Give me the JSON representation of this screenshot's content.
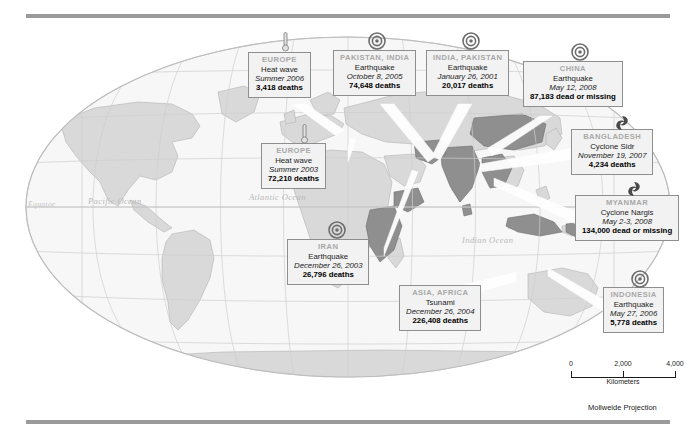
{
  "figure": {
    "projection_note": "Mollweide Projection"
  },
  "geo_labels": [
    {
      "name": "equator",
      "text": "Equator",
      "x": 28,
      "y": 228,
      "size": 7.5
    },
    {
      "name": "pacific-ocean",
      "text": "Pacific Ocean",
      "x": 88,
      "y": 198,
      "size": 8.5
    },
    {
      "name": "atlantic-ocean",
      "text": "Atlantic Ocean",
      "x": 249,
      "y": 194,
      "size": 8.5
    },
    {
      "name": "indian-ocean",
      "text": "Indian Ocean",
      "x": 462,
      "y": 237,
      "size": 8.5
    }
  ],
  "scalebar": {
    "ticks": [
      "0",
      "2,000",
      "4,000"
    ],
    "units": "Kilometers"
  },
  "events": [
    {
      "id": "europe-2006",
      "place": "EUROPE",
      "kind": "Heat wave",
      "date": "Summer 2006",
      "toll": "3,418 deaths",
      "icon": "thermometer-icon",
      "box": {
        "left": 248,
        "top": 52,
        "width": 74
      },
      "icon_pos": {
        "left": 274,
        "top": 32
      },
      "leader": {
        "x1": 288,
        "y1": 104,
        "x2": 338,
        "y2": 125,
        "x3": 292,
        "y3": 108
      }
    },
    {
      "id": "pakistan-india-2005",
      "place": "PAKISTAN, INDIA",
      "kind": "Earthquake",
      "date": "October 8, 2005",
      "toll": "74,648 deaths",
      "icon": "epicenter-icon",
      "box": {
        "left": 335,
        "top": 52,
        "width": 84
      },
      "icon_pos": {
        "left": 366,
        "top": 30
      },
      "leader": {
        "x1": 378,
        "y1": 104,
        "x2": 429,
        "y2": 151,
        "x3": 384,
        "y3": 104
      }
    },
    {
      "id": "india-pakistan-2001",
      "place": "INDIA, PAKISTAN",
      "kind": "Earthquake",
      "date": "January 26, 2001",
      "toll": "20,017 deaths",
      "icon": "epicenter-icon",
      "box": {
        "left": 428,
        "top": 52,
        "width": 86
      },
      "icon_pos": {
        "left": 460,
        "top": 30
      },
      "leader": {
        "x1": 462,
        "y1": 104,
        "x2": 430,
        "y2": 158,
        "x3": 470,
        "y3": 104
      }
    },
    {
      "id": "china-2008",
      "place": "CHINA",
      "kind": "Earthquake",
      "date": "May 12, 2008",
      "toll": "87,183 dead or missing",
      "icon": "epicenter-icon",
      "box": {
        "left": 524,
        "top": 62,
        "width": 112
      },
      "icon_pos": {
        "left": 569,
        "top": 41
      },
      "leader": {
        "x1": 545,
        "y1": 114,
        "x2": 487,
        "y2": 152,
        "x3": 552,
        "y3": 114
      }
    },
    {
      "id": "bangladesh-2007",
      "place": "BANGLADESH",
      "kind": "Cyclone Sidr",
      "date": "November 19, 2007",
      "toll": "4,234 deaths",
      "icon": "cyclone-icon",
      "box": {
        "left": 572,
        "top": 130,
        "width": 96
      },
      "icon_pos": {
        "left": 611,
        "top": 112
      },
      "leader": {
        "x1": 572,
        "y1": 148,
        "x2": 478,
        "y2": 168,
        "x3": 572,
        "y3": 160
      }
    },
    {
      "id": "myanmar-2008",
      "place": "MYANMAR",
      "kind": "Cyclone Nargis",
      "date": "May 2-3, 2008",
      "toll": "134,000 dead or missing",
      "icon": "cyclone-icon",
      "box": {
        "left": 576,
        "top": 196,
        "width": 116
      },
      "icon_pos": {
        "left": 623,
        "top": 178
      },
      "leader": {
        "x1": 576,
        "y1": 212,
        "x2": 492,
        "y2": 180,
        "x3": 576,
        "y3": 224
      }
    },
    {
      "id": "indonesia-2006",
      "place": "INDONESIA",
      "kind": "Earthquake",
      "date": "May 27, 2006",
      "toll": "5,778 deaths",
      "icon": "epicenter-icon",
      "box": {
        "left": 604,
        "top": 288,
        "width": 72
      },
      "icon_pos": {
        "left": 629,
        "top": 268
      },
      "leader": {
        "x1": 604,
        "y1": 300,
        "x2": 545,
        "y2": 268,
        "x3": 604,
        "y3": 312
      }
    },
    {
      "id": "asia-africa-2004",
      "place": "ASIA, AFRICA",
      "kind": "Tsunami",
      "date": "December 26, 2004",
      "toll": "226,408 deaths",
      "icon": "none",
      "box": {
        "left": 400,
        "top": 286,
        "width": 96
      },
      "icon_pos": null,
      "leader": {
        "x1": 400,
        "y1": 300,
        "x2": 520,
        "y2": 276,
        "x3": 400,
        "y3": 312
      }
    },
    {
      "id": "iran-2003",
      "place": "IRAN",
      "kind": "Earthquake",
      "date": "December 26, 2003",
      "toll": "26,796 deaths",
      "icon": "epicenter-icon",
      "box": {
        "left": 288,
        "top": 240,
        "width": 96
      },
      "icon_pos": {
        "left": 326,
        "top": 219
      },
      "leader": {
        "x1": 384,
        "y1": 248,
        "x2": 415,
        "y2": 167,
        "x3": 384,
        "y3": 256
      }
    },
    {
      "id": "europe-2003",
      "place": "EUROPE",
      "kind": "Heat wave",
      "date": "Summer 2003",
      "toll": "72,210 deaths",
      "icon": "thermometer-icon",
      "box": {
        "left": 262,
        "top": 142,
        "width": 86
      },
      "icon_pos": {
        "left": 293,
        "top": 124
      },
      "leader": {
        "x1": 348,
        "y1": 150,
        "x2": 352,
        "y2": 134,
        "x3": 348,
        "y3": 162
      }
    }
  ]
}
